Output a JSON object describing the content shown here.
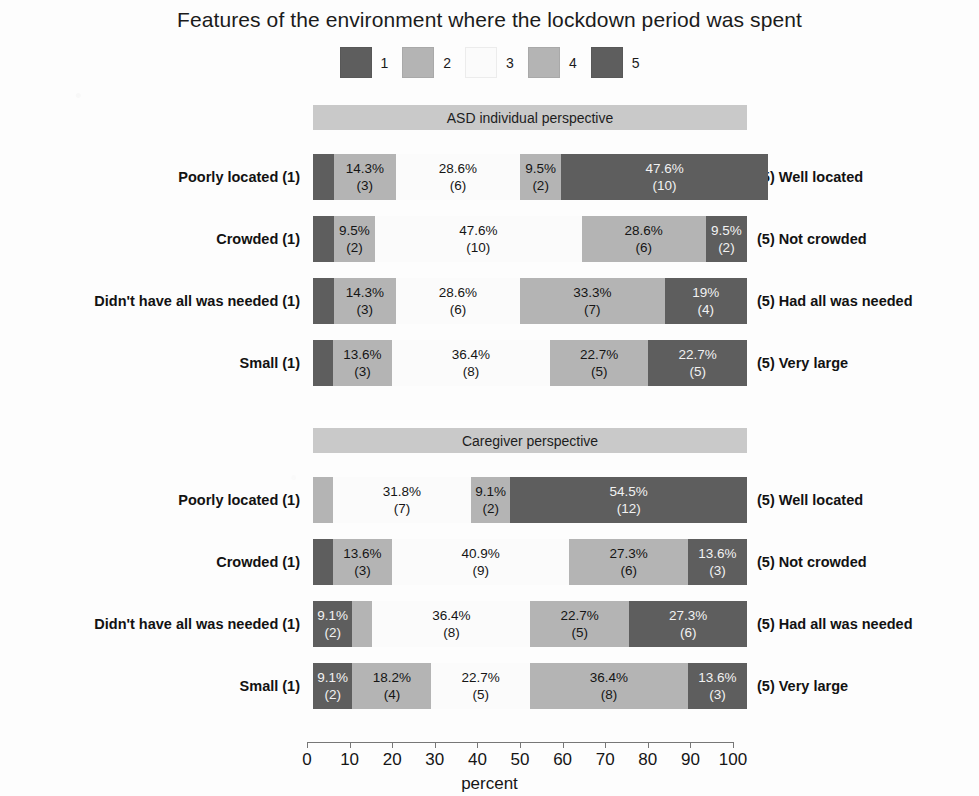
{
  "chart_data": {
    "type": "bar",
    "subtype": "stacked-horizontal-likert",
    "title": "Features of the environment where the lockdown period was spent",
    "xlabel": "percent",
    "ylabel": "",
    "xlim": [
      0,
      100
    ],
    "xticks": [
      0,
      10,
      20,
      30,
      40,
      50,
      60,
      70,
      80,
      90,
      100
    ],
    "grid": false,
    "legend_position": "top-center",
    "legend": [
      "1",
      "2",
      "3",
      "4",
      "5"
    ],
    "colors": {
      "1": "#5e5e5e",
      "2": "#b4b4b4",
      "3": "#fbfbfb",
      "4": "#b4b4b4",
      "5": "#5e5e5e",
      "panel_strip": "#c9c9c9"
    },
    "panels": [
      {
        "name": "ASD individual perspective",
        "rows": [
          {
            "left_label": "Poorly located (1)",
            "right_label": "(5) Well located",
            "segments": [
              {
                "level": "1",
                "percent": 4.8,
                "count": 1,
                "pct_label": "",
                "count_label": "",
                "show_label": false
              },
              {
                "level": "2",
                "percent": 14.3,
                "count": 3,
                "pct_label": "14.3%",
                "count_label": "(3)",
                "show_label": true
              },
              {
                "level": "3",
                "percent": 28.6,
                "count": 6,
                "pct_label": "28.6%",
                "count_label": "(6)",
                "show_label": true
              },
              {
                "level": "4",
                "percent": 9.5,
                "count": 2,
                "pct_label": "9.5%",
                "count_label": "(2)",
                "show_label": true
              },
              {
                "level": "5",
                "percent": 47.6,
                "count": 10,
                "pct_label": "47.6%",
                "count_label": "(10)",
                "show_label": true
              }
            ]
          },
          {
            "left_label": "Crowded (1)",
            "right_label": "(5) Not crowded",
            "segments": [
              {
                "level": "1",
                "percent": 4.8,
                "count": 1,
                "pct_label": "",
                "count_label": "",
                "show_label": false
              },
              {
                "level": "2",
                "percent": 9.5,
                "count": 2,
                "pct_label": "9.5%",
                "count_label": "(2)",
                "show_label": true
              },
              {
                "level": "3",
                "percent": 47.6,
                "count": 10,
                "pct_label": "47.6%",
                "count_label": "(10)",
                "show_label": true
              },
              {
                "level": "4",
                "percent": 28.6,
                "count": 6,
                "pct_label": "28.6%",
                "count_label": "(6)",
                "show_label": true
              },
              {
                "level": "5",
                "percent": 9.5,
                "count": 2,
                "pct_label": "9.5%",
                "count_label": "(2)",
                "show_label": true
              }
            ]
          },
          {
            "left_label": "Didn't have all was needed (1)",
            "right_label": "(5) Had all was needed",
            "segments": [
              {
                "level": "1",
                "percent": 4.8,
                "count": 1,
                "pct_label": "",
                "count_label": "",
                "show_label": false
              },
              {
                "level": "2",
                "percent": 14.3,
                "count": 3,
                "pct_label": "14.3%",
                "count_label": "(3)",
                "show_label": true
              },
              {
                "level": "3",
                "percent": 28.6,
                "count": 6,
                "pct_label": "28.6%",
                "count_label": "(6)",
                "show_label": true
              },
              {
                "level": "4",
                "percent": 33.3,
                "count": 7,
                "pct_label": "33.3%",
                "count_label": "(7)",
                "show_label": true
              },
              {
                "level": "5",
                "percent": 19.0,
                "count": 4,
                "pct_label": "19%",
                "count_label": "(4)",
                "show_label": true
              }
            ]
          },
          {
            "left_label": "Small (1)",
            "right_label": "(5) Very large",
            "segments": [
              {
                "level": "1",
                "percent": 4.6,
                "count": 1,
                "pct_label": "",
                "count_label": "",
                "show_label": false
              },
              {
                "level": "2",
                "percent": 13.6,
                "count": 3,
                "pct_label": "13.6%",
                "count_label": "(3)",
                "show_label": true
              },
              {
                "level": "3",
                "percent": 36.4,
                "count": 8,
                "pct_label": "36.4%",
                "count_label": "(8)",
                "show_label": true
              },
              {
                "level": "4",
                "percent": 22.7,
                "count": 5,
                "pct_label": "22.7%",
                "count_label": "(5)",
                "show_label": true
              },
              {
                "level": "5",
                "percent": 22.7,
                "count": 5,
                "pct_label": "22.7%",
                "count_label": "(5)",
                "show_label": true
              }
            ]
          }
        ]
      },
      {
        "name": "Caregiver perspective",
        "rows": [
          {
            "left_label": "Poorly located (1)",
            "right_label": "(5) Well located",
            "segments": [
              {
                "level": "2",
                "percent": 4.6,
                "count": 1,
                "pct_label": "",
                "count_label": "",
                "show_label": false
              },
              {
                "level": "3",
                "percent": 31.8,
                "count": 7,
                "pct_label": "31.8%",
                "count_label": "(7)",
                "show_label": true
              },
              {
                "level": "4",
                "percent": 9.1,
                "count": 2,
                "pct_label": "9.1%",
                "count_label": "(2)",
                "show_label": true
              },
              {
                "level": "5",
                "percent": 54.5,
                "count": 12,
                "pct_label": "54.5%",
                "count_label": "(12)",
                "show_label": true
              }
            ]
          },
          {
            "left_label": "Crowded (1)",
            "right_label": "(5) Not crowded",
            "segments": [
              {
                "level": "1",
                "percent": 4.6,
                "count": 1,
                "pct_label": "",
                "count_label": "",
                "show_label": false
              },
              {
                "level": "2",
                "percent": 13.6,
                "count": 3,
                "pct_label": "13.6%",
                "count_label": "(3)",
                "show_label": true
              },
              {
                "level": "3",
                "percent": 40.9,
                "count": 9,
                "pct_label": "40.9%",
                "count_label": "(9)",
                "show_label": true
              },
              {
                "level": "4",
                "percent": 27.3,
                "count": 6,
                "pct_label": "27.3%",
                "count_label": "(6)",
                "show_label": true
              },
              {
                "level": "5",
                "percent": 13.6,
                "count": 3,
                "pct_label": "13.6%",
                "count_label": "(3)",
                "show_label": true
              }
            ]
          },
          {
            "left_label": "Didn't have all was needed (1)",
            "right_label": "(5) Had all was needed",
            "segments": [
              {
                "level": "1",
                "percent": 9.1,
                "count": 2,
                "pct_label": "9.1%",
                "count_label": "(2)",
                "show_label": true
              },
              {
                "level": "2",
                "percent": 4.6,
                "count": 1,
                "pct_label": "",
                "count_label": "",
                "show_label": false
              },
              {
                "level": "3",
                "percent": 36.4,
                "count": 8,
                "pct_label": "36.4%",
                "count_label": "(8)",
                "show_label": true
              },
              {
                "level": "4",
                "percent": 22.7,
                "count": 5,
                "pct_label": "22.7%",
                "count_label": "(5)",
                "show_label": true
              },
              {
                "level": "5",
                "percent": 27.3,
                "count": 6,
                "pct_label": "27.3%",
                "count_label": "(6)",
                "show_label": true
              }
            ]
          },
          {
            "left_label": "Small (1)",
            "right_label": "(5) Very large",
            "segments": [
              {
                "level": "1",
                "percent": 9.1,
                "count": 2,
                "pct_label": "9.1%",
                "count_label": "(2)",
                "show_label": true
              },
              {
                "level": "2",
                "percent": 18.2,
                "count": 4,
                "pct_label": "18.2%",
                "count_label": "(4)",
                "show_label": true
              },
              {
                "level": "3",
                "percent": 22.7,
                "count": 5,
                "pct_label": "22.7%",
                "count_label": "(5)",
                "show_label": true
              },
              {
                "level": "4",
                "percent": 36.4,
                "count": 8,
                "pct_label": "36.4%",
                "count_label": "(8)",
                "show_label": true
              },
              {
                "level": "5",
                "percent": 13.6,
                "count": 3,
                "pct_label": "13.6%",
                "count_label": "(3)",
                "show_label": true
              }
            ]
          }
        ]
      }
    ]
  }
}
